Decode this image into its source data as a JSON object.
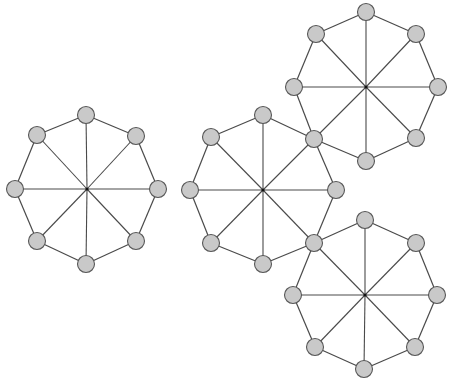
{
  "diagram": {
    "type": "graph",
    "colors": {
      "background": "#ffffff",
      "node_fill": "#c9c9c9",
      "node_stroke": "#575757",
      "edge": "#4a4a4a",
      "hub": "#111111"
    },
    "node_radius": 8.5,
    "wheels": [
      {
        "id": "wheel-left",
        "center": [
          87,
          189
        ],
        "rim": [
          [
            86,
            115
          ],
          [
            136,
            136
          ],
          [
            158,
            189
          ],
          [
            136,
            241
          ],
          [
            86,
            264
          ],
          [
            37,
            241
          ],
          [
            15,
            189
          ],
          [
            37,
            135
          ]
        ]
      },
      {
        "id": "wheel-middle",
        "center": [
          263,
          190
        ],
        "rim": [
          [
            263,
            115
          ],
          [
            314,
            139
          ],
          [
            336,
            190
          ],
          [
            314,
            243
          ],
          [
            263,
            264
          ],
          [
            211,
            243
          ],
          [
            190,
            190
          ],
          [
            211,
            137
          ]
        ]
      },
      {
        "id": "wheel-top-right",
        "center": [
          366,
          87
        ],
        "rim": [
          [
            366,
            12
          ],
          [
            416,
            34
          ],
          [
            438,
            87
          ],
          [
            416,
            138
          ],
          [
            366,
            161
          ],
          [
            314,
            139
          ],
          [
            294,
            87
          ],
          [
            316,
            34
          ]
        ]
      },
      {
        "id": "wheel-bottom-right",
        "center": [
          365,
          295
        ],
        "rim": [
          [
            365,
            220
          ],
          [
            416,
            243
          ],
          [
            437,
            295
          ],
          [
            415,
            347
          ],
          [
            364,
            369
          ],
          [
            315,
            347
          ],
          [
            293,
            295
          ],
          [
            314,
            243
          ]
        ]
      }
    ],
    "shared_nodes": [
      [
        314,
        139
      ],
      [
        314,
        243
      ]
    ]
  }
}
